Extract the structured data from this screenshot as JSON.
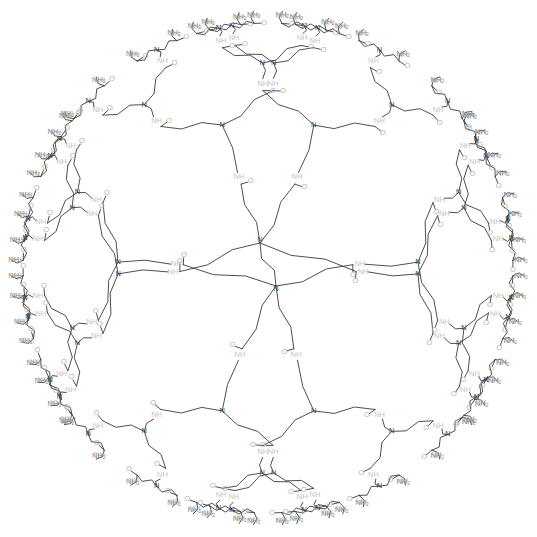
{
  "diagram": {
    "title": "",
    "type": "PAMAM dendrimer structure",
    "core": {
      "label_a": "N",
      "label_b": "N",
      "linker": "ethylenediamine"
    },
    "generations": 4,
    "branching": 2,
    "core_arms": 4,
    "atom_labels": {
      "branch_nitrogen": "N",
      "amide_nh": "NH",
      "carbonyl_o": "O",
      "terminal_amine": "NH",
      "terminal_amine_sub": "2"
    },
    "colors": {
      "bond": "#3a3a3a",
      "label": "#8a8a8a",
      "amide_label": "#c4c4c4",
      "background": "#ffffff"
    }
  }
}
